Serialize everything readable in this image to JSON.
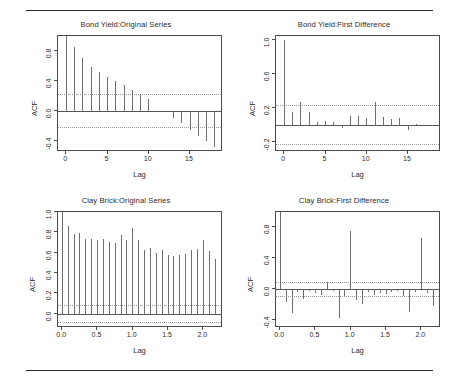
{
  "figure": {
    "width": 459,
    "height": 386,
    "background": "#ffffff",
    "rule_color": "#2a2a2a",
    "bar_color": "#6e6e6e",
    "ci_color": "#9a9a9a",
    "axis_color": "#4a4a4a"
  },
  "chart_data": [
    {
      "type": "bar",
      "id": "bond-yield-original",
      "title": "Bond Yield:Original Series",
      "xlabel": "Lag",
      "ylabel": "ACF",
      "xlim": [
        -1,
        19
      ],
      "ylim": [
        -0.55,
        1.0
      ],
      "xticks": [
        0,
        5,
        10,
        15
      ],
      "xticklabels": [
        "0",
        "5",
        "10",
        "15"
      ],
      "yticks": [
        -0.4,
        0.0,
        0.4,
        0.8
      ],
      "yticklabels": [
        "-0.4",
        "0.0",
        "0.4",
        "0.8"
      ],
      "grid": false,
      "confidence_bounds": [
        0.22,
        -0.22
      ],
      "x": [
        0,
        1,
        2,
        3,
        4,
        5,
        6,
        7,
        8,
        9,
        10,
        11,
        12,
        13,
        14,
        15,
        16,
        17,
        18
      ],
      "values": [
        1.0,
        0.85,
        0.71,
        0.59,
        0.52,
        0.45,
        0.4,
        0.34,
        0.28,
        0.22,
        0.16,
        0.0,
        -0.01,
        -0.1,
        -0.16,
        -0.25,
        -0.33,
        -0.4,
        -0.48
      ]
    },
    {
      "type": "bar",
      "id": "bond-yield-first-difference",
      "title": "Bond Yield:First Difference",
      "xlabel": "Lag",
      "ylabel": "ACF",
      "xlim": [
        -1,
        19
      ],
      "ylim": [
        -0.32,
        1.05
      ],
      "xticks": [
        0,
        5,
        10,
        15
      ],
      "xticklabels": [
        "0",
        "5",
        "10",
        "15"
      ],
      "yticks": [
        -0.2,
        0.2,
        0.6,
        1.0
      ],
      "yticklabels": [
        "-0.2",
        "0.2",
        "0.6",
        "1.0"
      ],
      "grid": false,
      "confidence_bounds": [
        0.23,
        -0.23
      ],
      "x": [
        0,
        1,
        2,
        3,
        4,
        5,
        6,
        7,
        8,
        9,
        10,
        11,
        12,
        13,
        14,
        15,
        16,
        17,
        18
      ],
      "values": [
        1.0,
        0.15,
        0.27,
        0.15,
        0.04,
        0.05,
        0.04,
        -0.04,
        0.1,
        0.1,
        0.08,
        0.27,
        0.09,
        0.07,
        0.08,
        -0.06,
        0.01,
        0.0,
        0.0
      ]
    },
    {
      "type": "bar",
      "id": "clay-brick-original",
      "title": "Clay Brick:Original Series",
      "xlabel": "Lag",
      "ylabel": "ACF",
      "xlim": [
        -0.06,
        2.28
      ],
      "ylim": [
        -0.14,
        1.0
      ],
      "xticks": [
        0.0,
        0.5,
        1.0,
        1.5,
        2.0
      ],
      "xticklabels": [
        "0.0",
        "0.5",
        "1.0",
        "1.5",
        "2.0"
      ],
      "yticks": [
        0.0,
        0.2,
        0.4,
        0.6,
        0.8,
        1.0
      ],
      "yticklabels": [
        "0.0",
        "0.2",
        "0.4",
        "0.6",
        "0.8",
        "1.0"
      ],
      "grid": false,
      "confidence_bounds": [
        0.085,
        -0.085
      ],
      "x": [
        0.0,
        0.083,
        0.167,
        0.25,
        0.333,
        0.417,
        0.5,
        0.583,
        0.667,
        0.75,
        0.833,
        0.917,
        1.0,
        1.083,
        1.167,
        1.25,
        1.333,
        1.417,
        1.5,
        1.583,
        1.667,
        1.75,
        1.833,
        1.917,
        2.0,
        2.083,
        2.167
      ],
      "values": [
        1.0,
        0.86,
        0.78,
        0.79,
        0.73,
        0.73,
        0.72,
        0.73,
        0.71,
        0.7,
        0.77,
        0.72,
        0.84,
        0.72,
        0.63,
        0.65,
        0.6,
        0.63,
        0.58,
        0.57,
        0.58,
        0.59,
        0.63,
        0.64,
        0.72,
        0.62,
        0.54
      ]
    },
    {
      "type": "bar",
      "id": "clay-brick-first-difference",
      "title": "Clay Brick:First Difference",
      "xlabel": "Lag",
      "ylabel": "ACF",
      "xlim": [
        -0.06,
        2.28
      ],
      "ylim": [
        -0.5,
        1.0
      ],
      "xticks": [
        0.0,
        0.5,
        1.0,
        1.5,
        2.0
      ],
      "xticklabels": [
        "0.0",
        "0.5",
        "1.0",
        "1.5",
        "2.0"
      ],
      "yticks": [
        -0.4,
        0.0,
        0.4,
        0.8
      ],
      "yticklabels": [
        "-0.4",
        "0.0",
        "0.4",
        "0.8"
      ],
      "grid": false,
      "confidence_bounds": [
        0.09,
        -0.09
      ],
      "x": [
        0.0,
        0.083,
        0.167,
        0.25,
        0.333,
        0.417,
        0.5,
        0.583,
        0.667,
        0.75,
        0.833,
        0.917,
        1.0,
        1.083,
        1.167,
        1.25,
        1.333,
        1.417,
        1.5,
        1.583,
        1.667,
        1.75,
        1.833,
        1.917,
        2.0,
        2.083,
        2.167
      ],
      "values": [
        1.0,
        -0.17,
        -0.31,
        -0.04,
        -0.12,
        -0.02,
        -0.05,
        -0.07,
        0.09,
        -0.02,
        -0.37,
        -0.08,
        0.76,
        -0.14,
        -0.19,
        -0.03,
        -0.07,
        -0.05,
        -0.06,
        -0.04,
        -0.02,
        -0.08,
        -0.29,
        -0.04,
        0.67,
        -0.05,
        -0.21
      ]
    }
  ]
}
